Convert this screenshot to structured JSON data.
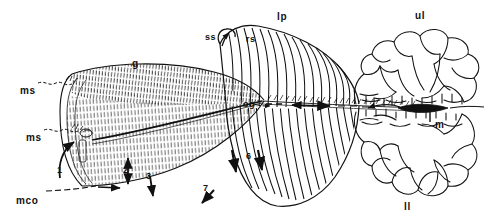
{
  "figure": {
    "width": 495,
    "height": 222,
    "background": "#ffffff",
    "ink": "#111111"
  },
  "labels": [
    {
      "id": "ms-upper",
      "text": "ms",
      "x": 20,
      "y": 86,
      "size": 10,
      "leader": "dashed-right"
    },
    {
      "id": "ms-lower",
      "text": "ms",
      "x": 26,
      "y": 133,
      "size": 10,
      "leader": "dashed-right"
    },
    {
      "id": "mco",
      "text": "mco",
      "x": 16,
      "y": 196,
      "size": 10,
      "leader": "dashed-right"
    },
    {
      "id": "g",
      "text": "g",
      "x": 132,
      "y": 59,
      "size": 10,
      "leader": "none"
    },
    {
      "id": "ss",
      "text": "ss",
      "x": 208,
      "y": 33,
      "size": 9,
      "leader": "arrow-up-right"
    },
    {
      "id": "rs",
      "text": "rs",
      "x": 246,
      "y": 35,
      "size": 9,
      "leader": "none"
    },
    {
      "id": "lp",
      "text": "lp",
      "x": 277,
      "y": 12,
      "size": 10,
      "leader": "none"
    },
    {
      "id": "og",
      "text": "og",
      "x": 246,
      "y": 100,
      "size": 9,
      "leader": "arrow-right"
    },
    {
      "id": "ul",
      "text": "ul",
      "x": 415,
      "y": 11,
      "size": 10,
      "leader": "none"
    },
    {
      "id": "m",
      "text": "m",
      "x": 437,
      "y": 119,
      "size": 10,
      "leader": "line-up"
    },
    {
      "id": "ll",
      "text": "ll",
      "x": 404,
      "y": 205,
      "size": 10,
      "leader": "none"
    }
  ],
  "flow_numbers": [
    {
      "id": "flow-1",
      "text": "1",
      "x": 57,
      "y": 168,
      "arrow": "up-curved"
    },
    {
      "id": "flow-2",
      "text": "2",
      "x": 124,
      "y": 172,
      "arrow": "down"
    },
    {
      "id": "flow-3",
      "text": "3",
      "x": 148,
      "y": 180,
      "arrow": "down-right"
    },
    {
      "id": "flow-6",
      "text": "6",
      "x": 248,
      "y": 157,
      "arrow": "down"
    },
    {
      "id": "flow-7",
      "text": "7",
      "x": 203,
      "y": 190,
      "arrow": "down-left"
    }
  ],
  "anatomy_key": {
    "ms": "mantle surface",
    "mco": "mantle cavity opening",
    "g": "gill",
    "ss": "ssection",
    "rs": "r surface",
    "lp": "labial palp",
    "og": "oral groove",
    "ul": "upper lobe",
    "ll": "lower lobe",
    "m": "mouth"
  }
}
